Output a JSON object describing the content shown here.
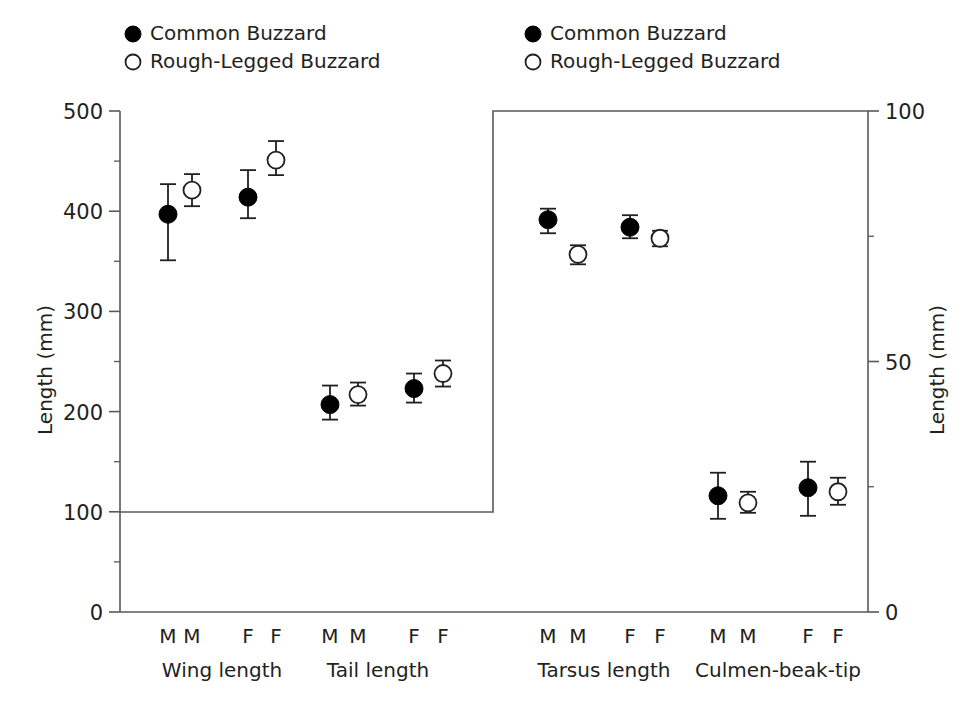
{
  "figure": {
    "background_color": "#ffffff",
    "marker_filled_color": "#000000",
    "marker_open_color": "#ffffff",
    "axis_color": "#58595b"
  },
  "legend_left": {
    "name": "legend-left",
    "entries": [
      {
        "marker": "filled-circle",
        "label": "Common Buzzard"
      },
      {
        "marker": "open-circle",
        "label": "Rough-Legged Buzzard"
      }
    ]
  },
  "legend_right": {
    "name": "legend-right",
    "entries": [
      {
        "marker": "filled-circle",
        "label": "Common Buzzard"
      },
      {
        "marker": "open-circle",
        "label": "Rough-Legged Buzzard"
      }
    ]
  },
  "left_axis": {
    "title": "Length (mm)",
    "ticks": [
      "0",
      "100",
      "200",
      "300",
      "400",
      "500"
    ],
    "min": 0,
    "max": 500
  },
  "right_axis": {
    "title": "Length (mm)",
    "ticks": [
      "0",
      "50",
      "100"
    ],
    "minor_ticks": [
      "25",
      "75"
    ],
    "min": 0,
    "max": 100
  },
  "sex_labels": {
    "male": "M",
    "female": "F"
  },
  "chart_data": {
    "type": "scatter",
    "title": "",
    "subtitle": "",
    "xlabel": "",
    "ylabel": "Length (mm)",
    "grid": false,
    "legend_position": "top",
    "error_bar_type": "range",
    "panels": [
      {
        "name": "left-panel",
        "axis": "left",
        "ylabel": "Length (mm)",
        "ylim": [
          0,
          500
        ],
        "yticks": [
          0,
          100,
          200,
          300,
          400,
          500
        ],
        "groups": [
          {
            "label": "Wing length",
            "points": [
              {
                "sex": "M",
                "species": "Common Buzzard",
                "marker": "filled-circle",
                "value": 397,
                "low": 351,
                "high": 427
              },
              {
                "sex": "M",
                "species": "Rough-Legged Buzzard",
                "marker": "open-circle",
                "value": 421,
                "low": 405,
                "high": 437
              },
              {
                "sex": "F",
                "species": "Common Buzzard",
                "marker": "filled-circle",
                "value": 414,
                "low": 393,
                "high": 441
              },
              {
                "sex": "F",
                "species": "Rough-Legged Buzzard",
                "marker": "open-circle",
                "value": 451,
                "low": 436,
                "high": 470
              }
            ]
          },
          {
            "label": "Tail length",
            "points": [
              {
                "sex": "M",
                "species": "Common Buzzard",
                "marker": "filled-circle",
                "value": 207,
                "low": 192,
                "high": 226
              },
              {
                "sex": "M",
                "species": "Rough-Legged Buzzard",
                "marker": "open-circle",
                "value": 217,
                "low": 206,
                "high": 229
              },
              {
                "sex": "F",
                "species": "Common Buzzard",
                "marker": "filled-circle",
                "value": 223,
                "low": 209,
                "high": 238
              },
              {
                "sex": "F",
                "species": "Rough-Legged Buzzard",
                "marker": "open-circle",
                "value": 238,
                "low": 225,
                "high": 251
              }
            ]
          }
        ]
      },
      {
        "name": "right-panel",
        "axis": "right",
        "ylabel": "Length (mm)",
        "ylim": [
          0,
          100
        ],
        "yticks": [
          0,
          50,
          100
        ],
        "groups": [
          {
            "label": "Tarsus length",
            "points": [
              {
                "sex": "M",
                "species": "Common Buzzard",
                "marker": "filled-circle",
                "value": 78.3,
                "low": 75.6,
                "high": 80.5
              },
              {
                "sex": "M",
                "species": "Rough-Legged Buzzard",
                "marker": "open-circle",
                "value": 71.4,
                "low": 69.4,
                "high": 73.2
              },
              {
                "sex": "F",
                "species": "Common Buzzard",
                "marker": "filled-circle",
                "value": 76.8,
                "low": 74.6,
                "high": 79.2
              },
              {
                "sex": "F",
                "species": "Rough-Legged Buzzard",
                "marker": "open-circle",
                "value": 74.6,
                "low": 73.0,
                "high": 76.1
              }
            ]
          },
          {
            "label": "Culmen-beak-tip",
            "points": [
              {
                "sex": "M",
                "species": "Common Buzzard",
                "marker": "filled-circle",
                "value": 23.2,
                "low": 18.6,
                "high": 27.8
              },
              {
                "sex": "M",
                "species": "Rough-Legged Buzzard",
                "marker": "open-circle",
                "value": 21.8,
                "low": 19.8,
                "high": 24.0
              },
              {
                "sex": "F",
                "species": "Common Buzzard",
                "marker": "filled-circle",
                "value": 24.8,
                "low": 19.2,
                "high": 30.0
              },
              {
                "sex": "F",
                "species": "Rough-Legged Buzzard",
                "marker": "open-circle",
                "value": 24.0,
                "low": 21.4,
                "high": 26.8
              }
            ]
          }
        ]
      }
    ]
  }
}
